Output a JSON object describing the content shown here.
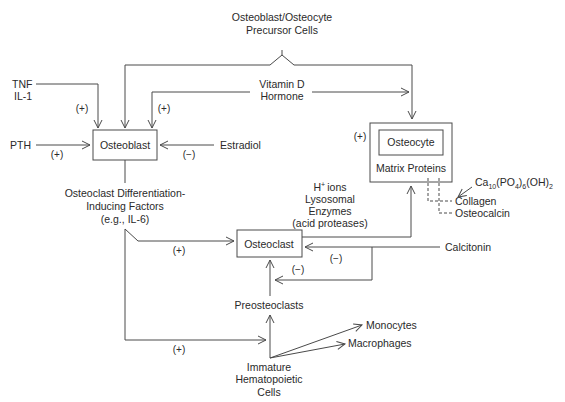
{
  "nodes": {
    "precursor": {
      "line1": "Osteoblast/Osteocyte",
      "line2": "Precursor Cells"
    },
    "osteoblast": {
      "label": "Osteoblast"
    },
    "osteocyte": {
      "label": "Osteocyte",
      "sublabel": "Matrix Proteins"
    },
    "osteoclast": {
      "label": "Osteoclast"
    },
    "preosteoclasts": {
      "label": "Preosteoclasts"
    },
    "hematopoietic": {
      "line1": "Immature",
      "line2": "Hematopoietic",
      "line3": "Cells"
    },
    "monocytes": {
      "label": "Monocytes"
    },
    "macrophages": {
      "label": "Macrophages"
    }
  },
  "factors": {
    "tnf": {
      "line1": "TNF",
      "line2": "IL-1"
    },
    "vitamin_d": {
      "line1": "Vitamin D",
      "line2": "Hormone"
    },
    "pth": {
      "label": "PTH"
    },
    "estradiol": {
      "label": "Estradiol"
    },
    "calcitonin": {
      "label": "Calcitonin"
    },
    "differentiation": {
      "line1": "Osteoclast Differentiation-",
      "line2": "Inducing Factors",
      "line3": "(e.g., IL-6)"
    },
    "secretions": {
      "line1": "ions",
      "line1_prefix": "H",
      "line1_sup": "+",
      "line2": "Lysosomal",
      "line3": "Enzymes",
      "line4": "(acid proteases)"
    },
    "mineral": {
      "ca": "Ca",
      "ca_sub": "10",
      "po4": "(PO",
      "po4_sub": "4",
      "po4_close": ")",
      "six": "6",
      "oh": "(OH)",
      "two": "2"
    },
    "collagen": {
      "label": "Collagen"
    },
    "osteocalcin": {
      "label": "Osteocalcin"
    }
  },
  "effects": {
    "tnf_osteoblast": "(+)",
    "vitd_osteoblast": "(+)",
    "pth_osteoblast": "(+)",
    "estradiol_osteoblast": "(−)",
    "vitd_osteocyte": "(+)",
    "diff_osteoclast": "(+)",
    "calcitonin_osteoclast": "(−)",
    "calcitonin_preosteoclast": "(−)",
    "diff_hematopoietic": "(+)"
  }
}
